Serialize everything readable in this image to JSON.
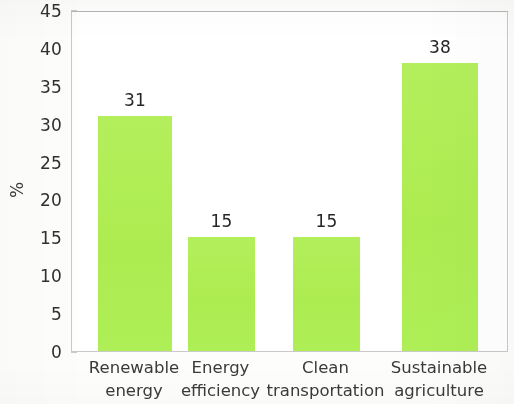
{
  "chart_data": {
    "type": "bar",
    "title": "",
    "subtitle": "",
    "xlabel": "",
    "ylabel": "%",
    "categories": [
      "Renewable energy",
      "Energy efficiency",
      "Clean transportation",
      "Sustainable agriculture"
    ],
    "category_lines": [
      [
        "Renewable",
        "energy"
      ],
      [
        "Energy",
        "efficiency"
      ],
      [
        "Clean",
        "transportation"
      ],
      [
        "Sustainable",
        "agriculture"
      ]
    ],
    "values": [
      31,
      15,
      15,
      38
    ],
    "value_labels": [
      "31",
      "15",
      "15",
      "38"
    ],
    "ylim": [
      0,
      45
    ],
    "ytick_values": [
      0,
      5,
      10,
      15,
      20,
      25,
      30,
      35,
      40,
      45
    ],
    "ytick_labels": [
      "0",
      "5",
      "10",
      "15",
      "20",
      "25",
      "30",
      "35",
      "40",
      "45"
    ],
    "grid": false,
    "legend": null,
    "legend_position": "none",
    "bar_color": "#B0EE56",
    "axis_color": "#C9C9C9",
    "text_color": "#303030",
    "background_color": "#FFFFFF"
  }
}
